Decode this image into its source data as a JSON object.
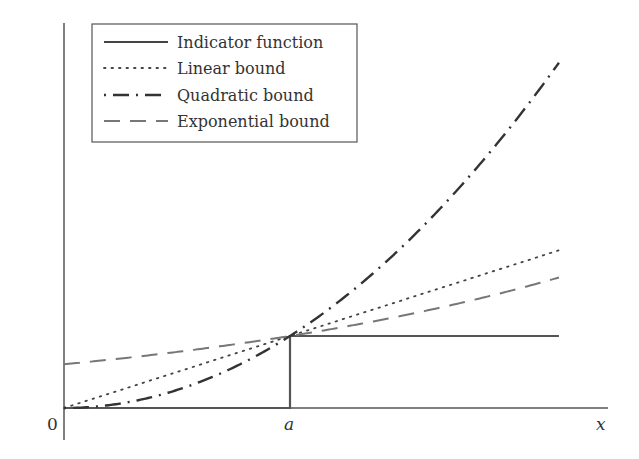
{
  "chart_data": {
    "type": "line",
    "title": "",
    "xlabel": "x",
    "ylabel": "",
    "x_ticks": [
      {
        "label": "0",
        "x": 0
      },
      {
        "label": "a",
        "x": 1
      }
    ],
    "xlim": [
      0,
      2.19
    ],
    "ylim": [
      0,
      5.4
    ],
    "grid": false,
    "legend_position": "upper left",
    "series": [
      {
        "name": "Indicator function",
        "style": "solid",
        "color": "#555555",
        "formula": "1 if x >= a else 0"
      },
      {
        "name": "Linear bound",
        "style": "dotted",
        "color": "#444444",
        "formula": "x / a"
      },
      {
        "name": "Quadratic bound",
        "style": "dashdot",
        "color": "#333333",
        "formula": "(x / a)^2"
      },
      {
        "name": "Exponential bound",
        "style": "dashed",
        "color": "#777777",
        "formula": "exp(0.5 * (x - a))"
      }
    ],
    "sample_points": {
      "x": [
        0,
        0.5,
        1,
        1.5,
        2,
        2.19
      ],
      "indicator": [
        0,
        0,
        1,
        1,
        1,
        1
      ],
      "linear": [
        0,
        0.5,
        1,
        1.5,
        2,
        2.19
      ],
      "quadratic": [
        0,
        0.25,
        1,
        2.25,
        4,
        4.78
      ],
      "exponential": [
        0.61,
        0.78,
        1,
        1.28,
        1.65,
        1.81
      ]
    }
  },
  "legend": {
    "items": [
      {
        "label": "Indicator function"
      },
      {
        "label": "Linear bound"
      },
      {
        "label": "Quadratic bound"
      },
      {
        "label": "Exponential bound"
      }
    ]
  },
  "axes": {
    "origin_label": "0",
    "a_label": "a",
    "x_label": "x"
  }
}
